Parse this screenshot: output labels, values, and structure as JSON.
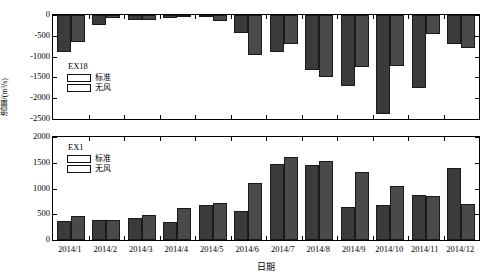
{
  "chart_data": [
    {
      "panel": "top",
      "type": "bar",
      "title": "EX18",
      "xlabel": "日期",
      "ylabel": "流量/(m³/s)",
      "ylim": [
        -2500,
        0
      ],
      "yticks": [
        0,
        -500,
        -1000,
        -1500,
        -2000,
        -2500
      ],
      "ytick_labels": [
        "0",
        "-500",
        "-1000",
        "-1500",
        "-2000",
        "-2500"
      ],
      "grid": false,
      "legend_position": "inside-left",
      "categories": [
        "2014/1",
        "2014/2",
        "2014/3",
        "2014/4",
        "2014/5",
        "2014/6",
        "2014/7",
        "2014/8",
        "2014/9",
        "2014/10",
        "2014/11",
        "2014/12"
      ],
      "series": [
        {
          "name": "标准",
          "color": "#3b3b3b",
          "values": [
            -880,
            -230,
            -110,
            -70,
            -50,
            -430,
            -900,
            -1320,
            -1700,
            -2380,
            -1760,
            -700
          ]
        },
        {
          "name": "无风",
          "color": "#4a4a4a",
          "values": [
            -660,
            -80,
            -120,
            -30,
            -140,
            -970,
            -700,
            -1500,
            -1250,
            -1230,
            -450,
            -790
          ]
        }
      ]
    },
    {
      "panel": "bottom",
      "type": "bar",
      "title": "EX1",
      "xlabel": "日期",
      "ylabel": "流量/(m³/s)",
      "ylim": [
        0,
        2000
      ],
      "yticks": [
        0,
        500,
        1000,
        1500,
        2000
      ],
      "ytick_labels": [
        "0",
        "500",
        "1000",
        "1500",
        "2000"
      ],
      "grid": false,
      "legend_position": "inside-left",
      "categories": [
        "2014/1",
        "2014/2",
        "2014/3",
        "2014/4",
        "2014/5",
        "2014/6",
        "2014/7",
        "2014/8",
        "2014/9",
        "2014/10",
        "2014/11",
        "2014/12"
      ],
      "series": [
        {
          "name": "标准",
          "color": "#3b3b3b",
          "values": [
            370,
            385,
            430,
            340,
            670,
            560,
            1480,
            1450,
            640,
            670,
            880,
            1400
          ]
        },
        {
          "name": "无风",
          "color": "#4a4a4a",
          "values": [
            460,
            380,
            490,
            630,
            725,
            1100,
            1620,
            1530,
            1320,
            1040,
            860,
            700
          ]
        }
      ]
    }
  ],
  "figure": {
    "xlabel": "日期",
    "ylabel": "流量/(m³/s)"
  }
}
